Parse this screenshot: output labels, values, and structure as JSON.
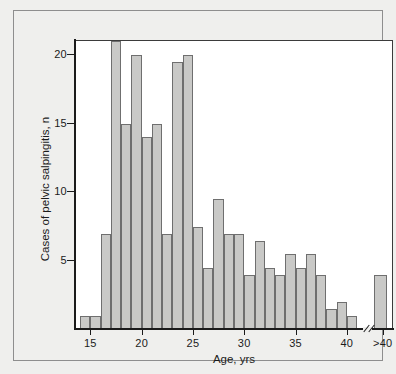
{
  "chart_data": {
    "type": "bar",
    "title": "",
    "xlabel": "Age, yrs",
    "ylabel": "Cases of pelvic salpingitis, n",
    "xlim": [
      13.5,
      44.5
    ],
    "ylim": [
      0,
      21
    ],
    "y_ticks": [
      5,
      10,
      15,
      20
    ],
    "x_ticks": [
      "15",
      "20",
      "25",
      "30",
      "35",
      "40",
      ">40"
    ],
    "x_tick_values": [
      15,
      20,
      25,
      30,
      35,
      40,
      43.5
    ],
    "grid": false,
    "legend": null,
    "axis_break_at": 42,
    "bar_fill_color": "#c9c9c7",
    "bar_edge_color": "#6f6f6f",
    "categories": [
      "14",
      "15",
      "16",
      "17",
      "18",
      "19",
      "20",
      "21",
      "22",
      "23",
      "24",
      "25",
      "26",
      "27",
      "28",
      "29",
      "30",
      "31",
      "32",
      "33",
      "34",
      "35",
      "36",
      "37",
      "38",
      "39",
      "40",
      ">40"
    ],
    "values": [
      1,
      1,
      7,
      21,
      15,
      20,
      14,
      15,
      7,
      19.5,
      20,
      7.5,
      4.5,
      9.5,
      7,
      7,
      4,
      6.5,
      4.5,
      4,
      5.5,
      4.5,
      5.5,
      4,
      1.5,
      2,
      1,
      4
    ]
  },
  "figure": {
    "background_color": "#efefed",
    "panel_color": "#ffffff",
    "frame_color": "#8e8e8e",
    "axis_color": "#1b1b1b"
  }
}
